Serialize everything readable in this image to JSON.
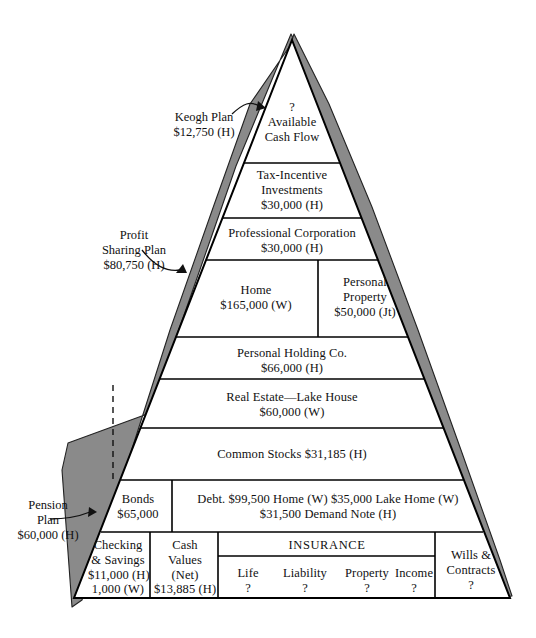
{
  "diagram": {
    "apex_label": {
      "question": "?",
      "line1": "Available",
      "line2": "Cash Flow"
    },
    "colors": {
      "wedge_fill": "#8a8a8a",
      "outline": "#000000",
      "background": "#ffffff",
      "text": "#111111"
    },
    "rows": [
      {
        "name": "available-cash-flow",
        "cells": [
          {
            "lines": [
              "?",
              "Available",
              "Cash Flow"
            ]
          }
        ]
      },
      {
        "name": "tax-incentive-investments",
        "cells": [
          {
            "lines": [
              "Tax-Incentive",
              "Investments",
              "$30,000 (H)"
            ]
          }
        ]
      },
      {
        "name": "professional-corporation",
        "cells": [
          {
            "lines": [
              "Professional Corporation",
              "$30,000 (H)"
            ]
          }
        ]
      },
      {
        "name": "home-and-personal-property",
        "cells": [
          {
            "lines": [
              "Home",
              "$165,000 (W)"
            ]
          },
          {
            "lines": [
              "Personal",
              "Property",
              "$50,000 (Jt)"
            ]
          }
        ]
      },
      {
        "name": "personal-holding-co",
        "cells": [
          {
            "lines": [
              "Personal Holding Co.",
              "$66,000 (H)"
            ]
          }
        ]
      },
      {
        "name": "real-estate-lake-house",
        "cells": [
          {
            "lines": [
              "Real Estate—Lake House",
              "$60,000 (W)"
            ]
          }
        ]
      },
      {
        "name": "common-stocks",
        "cells": [
          {
            "lines": [
              "Common Stocks $31,185 (H)"
            ]
          }
        ]
      },
      {
        "name": "bonds-and-debt",
        "cells": [
          {
            "lines": [
              "Bonds",
              "$65,000"
            ]
          },
          {
            "lines": [
              "Debt. $99,500 Home (W) $35,000 Lake Home (W)",
              "$31,500 Demand Note (H)"
            ]
          }
        ]
      },
      {
        "name": "liquid-assets-insurance-wills",
        "cells": [
          {
            "lines": [
              "Checking",
              "& Savings",
              "$11,000 (H)",
              "1,000 (W)"
            ]
          },
          {
            "lines": [
              "Cash",
              "Values",
              "(Net)",
              "$13,885 (H)"
            ]
          },
          {
            "lines": [
              "INSURANCE"
            ]
          },
          {
            "lines": [
              "Wills &",
              "Contracts",
              "?"
            ]
          }
        ]
      }
    ],
    "insurance": {
      "heading": "INSURANCE",
      "items": [
        {
          "label": "Life",
          "value": "?"
        },
        {
          "label": "Liability",
          "value": "?"
        },
        {
          "label": "Property",
          "value": "?"
        },
        {
          "label": "Income",
          "value": "?"
        }
      ]
    },
    "callouts": [
      {
        "name": "keogh-plan",
        "lines": [
          "Keogh Plan",
          "$12,750 (H)"
        ]
      },
      {
        "name": "profit-sharing-plan",
        "lines": [
          "Profit",
          "Sharing Plan",
          "$80,750 (H)"
        ]
      },
      {
        "name": "pension-plan",
        "lines": [
          "Pension",
          "Plan",
          "$60,000 (H)"
        ]
      }
    ]
  }
}
